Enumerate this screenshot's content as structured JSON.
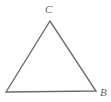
{
  "figure": {
    "type": "geometry-diagram",
    "shape": "triangle",
    "background_color": "#ffffff",
    "stroke_color": "#6b6b6b",
    "stroke_width": 1.4,
    "label_color": "#5f5f5f",
    "width": 111,
    "height": 102,
    "vertices": [
      {
        "id": "apex",
        "label": "C",
        "x": 50,
        "y": 21,
        "label_x": 48,
        "label_y": 10,
        "labeled": true
      },
      {
        "id": "bottom-right",
        "label": "B",
        "x": 96,
        "y": 91,
        "label_x": 103,
        "label_y": 94,
        "labeled": true
      },
      {
        "id": "bottom-left",
        "label": "",
        "x": 6,
        "y": 92,
        "label_x": 0,
        "label_y": 0,
        "labeled": false
      }
    ],
    "edges": [
      {
        "id": "edge-left",
        "from": "bottom-left",
        "to": "apex"
      },
      {
        "id": "edge-right",
        "from": "apex",
        "to": "bottom-right"
      },
      {
        "id": "edge-base",
        "from": "bottom-left",
        "to": "bottom-right"
      }
    ],
    "polygon_points": "6,92 50,21 96,91",
    "labels": {
      "apex": "C",
      "bottom_right": "B",
      "bottom_left": ""
    }
  }
}
